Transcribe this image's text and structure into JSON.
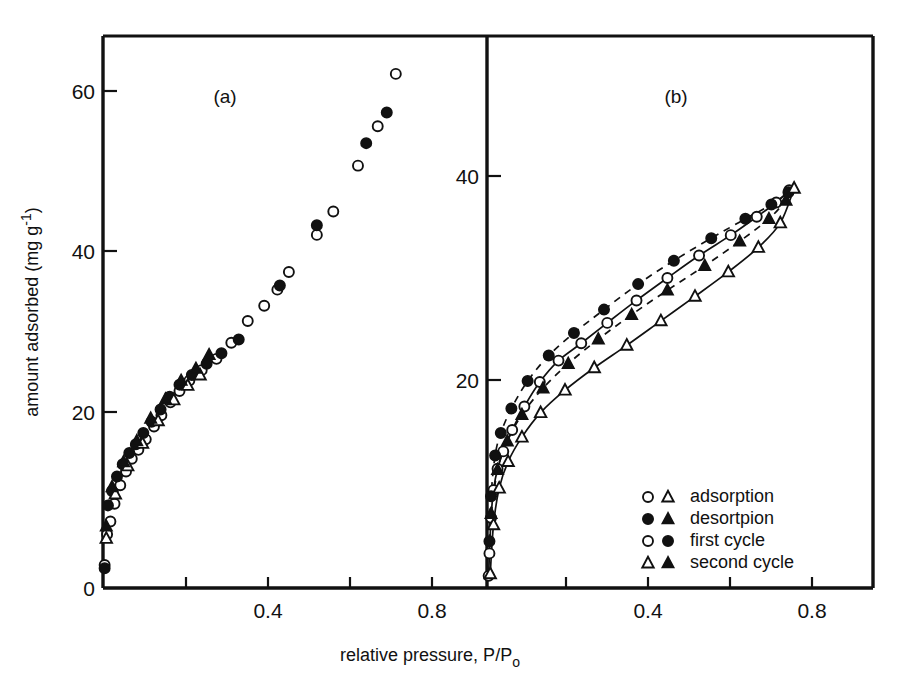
{
  "figure": {
    "background": "#ffffff",
    "ink": "#111111",
    "xlabel": "relative pressure, P/P",
    "xlabel_sub": "o",
    "ylabel": "amount adsorbed (mg g",
    "ylabel_sup": "-1",
    "ylabel_tail": ")"
  },
  "legend": {
    "position": "bottom-right-of-panel-b",
    "entries": [
      {
        "markers": "open-circle open-triangle",
        "label": "adsorption"
      },
      {
        "markers": "filled-circle filled-triangle",
        "label": "desortpion"
      },
      {
        "markers": "open-circle filled-circle",
        "label": "first cycle"
      },
      {
        "markers": "open-triangle filled-triangle",
        "label": "second cycle"
      }
    ]
  },
  "chart_data": [
    {
      "type": "scatter",
      "panel": "a",
      "title": "(a)",
      "xlabel": "relative pressure, P/Po",
      "ylabel": "amount adsorbed (mg g -1)",
      "xlim": [
        0,
        0.92
      ],
      "ylim": [
        0,
        68
      ],
      "xticks": [
        0,
        0.2,
        0.4,
        0.6,
        0.8
      ],
      "xticklabels": [
        "0",
        "",
        "0.4",
        "",
        "0.8"
      ],
      "yticks": [
        0,
        20,
        40,
        60
      ],
      "yticklabels": [
        "0",
        "20",
        "40",
        "60"
      ],
      "grid": false,
      "legend": false,
      "series": [
        {
          "name": "first cycle adsorption",
          "marker": "open-circle",
          "points": [
            [
              0.004,
              1.0
            ],
            [
              0.01,
              4.8
            ],
            [
              0.018,
              6.4
            ],
            [
              0.028,
              8.6
            ],
            [
              0.042,
              10.9
            ],
            [
              0.056,
              12.6
            ],
            [
              0.07,
              14.2
            ],
            [
              0.086,
              15.3
            ],
            [
              0.104,
              16.6
            ],
            [
              0.124,
              18.2
            ],
            [
              0.142,
              19.6
            ],
            [
              0.164,
              21.2
            ],
            [
              0.186,
              22.6
            ],
            [
              0.21,
              23.9
            ],
            [
              0.24,
              25.2
            ],
            [
              0.276,
              26.6
            ],
            [
              0.312,
              28.6
            ],
            [
              0.352,
              31.3
            ],
            [
              0.392,
              33.2
            ],
            [
              0.424,
              35.2
            ],
            [
              0.452,
              37.4
            ],
            [
              0.52,
              42.0
            ],
            [
              0.56,
              44.9
            ],
            [
              0.62,
              50.6
            ],
            [
              0.668,
              55.5
            ],
            [
              0.712,
              62.0
            ]
          ]
        },
        {
          "name": "first cycle desorption",
          "marker": "filled-circle",
          "points": [
            [
              0.004,
              0.6
            ],
            [
              0.012,
              8.4
            ],
            [
              0.022,
              10.2
            ],
            [
              0.034,
              12.0
            ],
            [
              0.048,
              13.5
            ],
            [
              0.064,
              14.9
            ],
            [
              0.08,
              16.0
            ],
            [
              0.098,
              17.4
            ],
            [
              0.118,
              18.8
            ],
            [
              0.14,
              20.3
            ],
            [
              0.162,
              21.9
            ],
            [
              0.186,
              23.4
            ],
            [
              0.216,
              24.6
            ],
            [
              0.252,
              26.0
            ],
            [
              0.288,
              27.3
            ],
            [
              0.33,
              29.0
            ],
            [
              0.43,
              35.7
            ],
            [
              0.52,
              43.2
            ],
            [
              0.64,
              53.4
            ],
            [
              0.69,
              57.2
            ]
          ]
        },
        {
          "name": "second cycle adsorption",
          "marker": "open-triangle",
          "points": [
            [
              0.008,
              4.3
            ],
            [
              0.03,
              9.8
            ],
            [
              0.06,
              13.3
            ],
            [
              0.096,
              16.1
            ],
            [
              0.134,
              18.9
            ],
            [
              0.172,
              21.5
            ],
            [
              0.206,
              23.3
            ],
            [
              0.236,
              24.6
            ]
          ]
        },
        {
          "name": "second cycle desorption",
          "marker": "filled-triangle",
          "points": [
            [
              0.008,
              5.8
            ],
            [
              0.022,
              10.7
            ],
            [
              0.05,
              13.8
            ],
            [
              0.082,
              16.4
            ],
            [
              0.116,
              19.2
            ],
            [
              0.152,
              21.6
            ],
            [
              0.19,
              23.9
            ],
            [
              0.226,
              25.4
            ],
            [
              0.258,
              27.1
            ]
          ]
        }
      ]
    },
    {
      "type": "scatter",
      "panel": "b",
      "title": "(b)",
      "xlabel": "relative pressure, P/Po",
      "ylabel": "amount adsorbed (mg g -1)",
      "xlim": [
        0,
        0.92
      ],
      "ylim": [
        0,
        47
      ],
      "xticks": [
        0,
        0.2,
        0.4,
        0.6,
        0.8
      ],
      "xticklabels": [
        "",
        "",
        "0.4",
        "",
        "0.8"
      ],
      "yticks": [
        20,
        40
      ],
      "yticklabels": [
        "20",
        "40"
      ],
      "grid": false,
      "legend": true,
      "series": [
        {
          "name": "first cycle adsorption",
          "marker": "open-circle",
          "line": "solid",
          "points": [
            [
              0.004,
              0.8
            ],
            [
              0.006,
              3.0
            ],
            [
              0.01,
              6.5
            ],
            [
              0.016,
              9.2
            ],
            [
              0.026,
              11.3
            ],
            [
              0.04,
              13.0
            ],
            [
              0.062,
              15.1
            ],
            [
              0.092,
              17.4
            ],
            [
              0.13,
              19.8
            ],
            [
              0.176,
              21.9
            ],
            [
              0.232,
              23.6
            ],
            [
              0.296,
              25.6
            ],
            [
              0.368,
              27.8
            ],
            [
              0.444,
              30.0
            ],
            [
              0.522,
              32.2
            ],
            [
              0.6,
              34.2
            ],
            [
              0.664,
              36.0
            ],
            [
              0.712,
              37.4
            ],
            [
              0.744,
              38.6
            ]
          ]
        },
        {
          "name": "first cycle desorption",
          "marker": "filled-circle",
          "line": "dashed",
          "points": [
            [
              0.006,
              4.2
            ],
            [
              0.01,
              8.6
            ],
            [
              0.02,
              12.6
            ],
            [
              0.034,
              14.8
            ],
            [
              0.06,
              17.2
            ],
            [
              0.1,
              19.9
            ],
            [
              0.152,
              22.4
            ],
            [
              0.214,
              24.6
            ],
            [
              0.288,
              26.9
            ],
            [
              0.372,
              29.4
            ],
            [
              0.46,
              31.7
            ],
            [
              0.552,
              33.9
            ],
            [
              0.636,
              35.8
            ],
            [
              0.7,
              37.2
            ],
            [
              0.742,
              38.4
            ]
          ]
        },
        {
          "name": "second cycle adsorption",
          "marker": "open-triangle",
          "line": "solid",
          "points": [
            [
              0.008,
              1.0
            ],
            [
              0.016,
              5.8
            ],
            [
              0.03,
              9.4
            ],
            [
              0.052,
              12.0
            ],
            [
              0.086,
              14.4
            ],
            [
              0.132,
              16.8
            ],
            [
              0.192,
              19.0
            ],
            [
              0.264,
              21.2
            ],
            [
              0.344,
              23.4
            ],
            [
              0.428,
              25.8
            ],
            [
              0.512,
              28.2
            ],
            [
              0.594,
              30.6
            ],
            [
              0.668,
              33.0
            ],
            [
              0.722,
              35.4
            ],
            [
              0.756,
              38.8
            ]
          ]
        },
        {
          "name": "second cycle desorption",
          "marker": "filled-triangle",
          "line": "dashed",
          "points": [
            [
              0.01,
              6.9
            ],
            [
              0.026,
              11.2
            ],
            [
              0.05,
              14.0
            ],
            [
              0.086,
              16.6
            ],
            [
              0.138,
              19.2
            ],
            [
              0.2,
              21.6
            ],
            [
              0.274,
              24.0
            ],
            [
              0.356,
              26.4
            ],
            [
              0.444,
              28.8
            ],
            [
              0.536,
              31.2
            ],
            [
              0.622,
              33.6
            ],
            [
              0.694,
              35.8
            ],
            [
              0.736,
              37.6
            ]
          ]
        }
      ]
    }
  ]
}
